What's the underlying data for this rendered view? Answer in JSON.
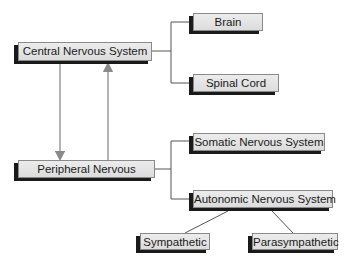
{
  "diagram": {
    "nodes": {
      "cns": {
        "label": "Central Nervous System"
      },
      "brain": {
        "label": "Brain"
      },
      "spinal": {
        "label": "Spinal Cord"
      },
      "pns": {
        "label": "Peripheral Nervous"
      },
      "somatic": {
        "label": "Somatic Nervous System"
      },
      "autonomic": {
        "label": "Autonomic Nervous System"
      },
      "sympathetic": {
        "label": "Sympathetic"
      },
      "parasympathetic": {
        "label": "Parasympathetic"
      }
    },
    "edges": [
      {
        "from": "cns",
        "to": "brain",
        "type": "bracket"
      },
      {
        "from": "cns",
        "to": "spinal",
        "type": "bracket"
      },
      {
        "from": "cns",
        "to": "pns",
        "type": "arrow-down"
      },
      {
        "from": "pns",
        "to": "cns",
        "type": "arrow-up"
      },
      {
        "from": "pns",
        "to": "somatic",
        "type": "bracket"
      },
      {
        "from": "pns",
        "to": "autonomic",
        "type": "bracket"
      },
      {
        "from": "autonomic",
        "to": "sympathetic",
        "type": "diagonal"
      },
      {
        "from": "autonomic",
        "to": "parasympathetic",
        "type": "diagonal"
      }
    ],
    "colors": {
      "box_fill": "#e0e0e0",
      "box_shadow": "#1a1a1a",
      "line": "#555555",
      "arrow": "#8a8a8a"
    }
  }
}
